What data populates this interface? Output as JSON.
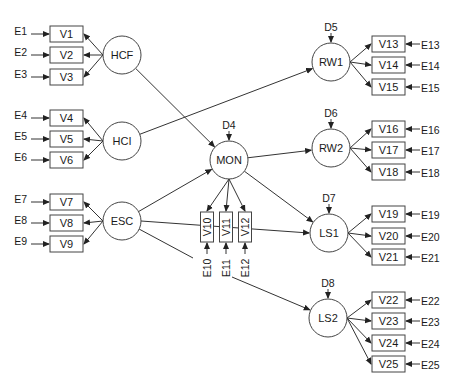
{
  "diagram": {
    "type": "structural-equation-model",
    "latent_factors": [
      {
        "id": "HCF",
        "label": "HCF",
        "cx": 122,
        "cy": 55,
        "disturbance": null
      },
      {
        "id": "HCI",
        "label": "HCI",
        "cx": 122,
        "cy": 141,
        "disturbance": null
      },
      {
        "id": "ESC",
        "label": "ESC",
        "cx": 122,
        "cy": 221,
        "disturbance": null
      },
      {
        "id": "MON",
        "label": "MON",
        "cx": 229,
        "cy": 160,
        "disturbance": "D4"
      },
      {
        "id": "RW1",
        "label": "RW1",
        "cx": 331,
        "cy": 62,
        "disturbance": "D5"
      },
      {
        "id": "RW2",
        "label": "RW2",
        "cx": 331,
        "cy": 148,
        "disturbance": "D6"
      },
      {
        "id": "LS1",
        "label": "LS1",
        "cx": 329,
        "cy": 233,
        "disturbance": "D7"
      },
      {
        "id": "LS2",
        "label": "LS2",
        "cx": 328,
        "cy": 318,
        "disturbance": "D8"
      }
    ],
    "indicators_left": [
      {
        "factor": "HCF",
        "items": [
          {
            "v": "V1",
            "e": "E1",
            "y": 34
          },
          {
            "v": "V2",
            "e": "E2",
            "y": 55
          },
          {
            "v": "V3",
            "e": "E3",
            "y": 77
          }
        ]
      },
      {
        "factor": "HCI",
        "items": [
          {
            "v": "V4",
            "e": "E4",
            "y": 118
          },
          {
            "v": "V5",
            "e": "E5",
            "y": 139
          },
          {
            "v": "V6",
            "e": "E6",
            "y": 160
          }
        ]
      },
      {
        "factor": "ESC",
        "items": [
          {
            "v": "V7",
            "e": "E7",
            "y": 202
          },
          {
            "v": "V8",
            "e": "E8",
            "y": 223
          },
          {
            "v": "V9",
            "e": "E9",
            "y": 244
          }
        ]
      }
    ],
    "indicators_mid": {
      "factor": "MON",
      "items": [
        {
          "v": "V10",
          "e": "E10",
          "x": 207
        },
        {
          "v": "V11",
          "e": "E11",
          "x": 226
        },
        {
          "v": "V12",
          "e": "E12",
          "x": 245
        }
      ]
    },
    "indicators_right": [
      {
        "factor": "RW1",
        "items": [
          {
            "v": "V13",
            "e": "E13",
            "y": 44
          },
          {
            "v": "V14",
            "e": "E14",
            "y": 65
          },
          {
            "v": "V15",
            "e": "E15",
            "y": 87
          }
        ]
      },
      {
        "factor": "RW2",
        "items": [
          {
            "v": "V16",
            "e": "E16",
            "y": 129
          },
          {
            "v": "V17",
            "e": "E17",
            "y": 150
          },
          {
            "v": "V18",
            "e": "E18",
            "y": 172
          }
        ]
      },
      {
        "factor": "LS1",
        "items": [
          {
            "v": "V19",
            "e": "E19",
            "y": 214
          },
          {
            "v": "V20",
            "e": "E20",
            "y": 236
          },
          {
            "v": "V21",
            "e": "E21",
            "y": 257
          }
        ]
      },
      {
        "factor": "LS2",
        "items": [
          {
            "v": "V22",
            "e": "E22",
            "y": 300
          },
          {
            "v": "V23",
            "e": "E23",
            "y": 321
          },
          {
            "v": "V24",
            "e": "E24",
            "y": 343
          },
          {
            "v": "V25",
            "e": "E25",
            "y": 364
          }
        ]
      }
    ],
    "structural_paths": [
      {
        "from": "HCF",
        "to": "MON"
      },
      {
        "from": "HCI",
        "to": "RW1"
      },
      {
        "from": "ESC",
        "to": "MON"
      },
      {
        "from": "ESC",
        "to": "LS1"
      },
      {
        "from": "ESC",
        "to": "LS2"
      },
      {
        "from": "MON",
        "to": "RW2"
      },
      {
        "from": "MON",
        "to": "LS1"
      }
    ]
  }
}
